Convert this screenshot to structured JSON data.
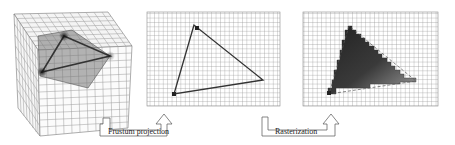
{
  "diagram": {
    "stages": [
      {
        "name": "3D view frustum",
        "description": "Triangle inside a wireframe cube"
      },
      {
        "name": "Projected triangle",
        "description": "Triangle outline on pixel grid"
      },
      {
        "name": "Rasterized triangle",
        "description": "Filled pixels on grid"
      }
    ],
    "arrows": [
      {
        "label": "Frustum projection",
        "from": 0,
        "to": 1
      },
      {
        "label": "Rasterization",
        "from": 1,
        "to": 2
      }
    ],
    "colors": {
      "grid": "#8a8a8a",
      "triangle_fill": "#6e6e6e",
      "edge": "#333333",
      "vertex": "#222222",
      "background": "#ffffff"
    }
  }
}
